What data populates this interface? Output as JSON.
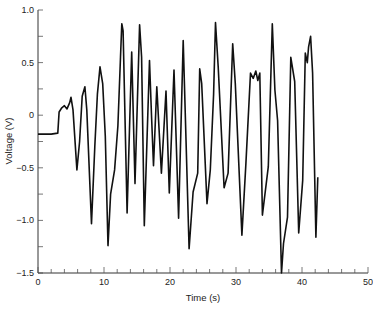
{
  "chart_data": {
    "type": "line",
    "title": "",
    "xlabel": "Time (s)",
    "ylabel": "Voltage (V)",
    "xlim": [
      0,
      50
    ],
    "ylim": [
      -1.5,
      1.0
    ],
    "x_ticks_major": [
      0,
      10,
      20,
      30,
      40,
      50
    ],
    "x_tick_labels": [
      "0",
      "10",
      "20",
      "30",
      "40",
      "50"
    ],
    "x_ticks_minor_step": 2,
    "y_ticks_major": [
      1.0,
      0.5,
      0,
      -0.5,
      -1.0,
      -1.5
    ],
    "y_tick_labels": [
      "1.0",
      "0.5",
      "0",
      "-0.5",
      "-1.0",
      "-1.5"
    ],
    "y_ticks_minor_step": 0.25,
    "grid": false,
    "legend": null,
    "line_color": "#111111",
    "series": [
      {
        "name": "Voltage",
        "x": [
          0,
          1,
          2,
          3.0,
          3.2,
          3.6,
          4.0,
          4.4,
          4.8,
          5.0,
          5.3,
          5.9,
          6.3,
          6.7,
          7.1,
          7.4,
          8.1,
          8.6,
          9.0,
          9.4,
          9.8,
          10.2,
          10.6,
          11.0,
          11.6,
          12.1,
          12.5,
          12.7,
          12.9,
          13.5,
          14.2,
          14.7,
          15.4,
          15.7,
          16.1,
          16.9,
          17.2,
          17.5,
          18.0,
          18.7,
          19.4,
          19.9,
          20.6,
          21.3,
          22.0,
          22.9,
          23.5,
          24.2,
          24.5,
          24.8,
          25.6,
          26.1,
          26.6,
          26.9,
          27.3,
          28.2,
          28.8,
          29.5,
          29.9,
          30.9,
          31.5,
          32.2,
          32.6,
          33.0,
          33.3,
          33.6,
          34.0,
          34.9,
          35.5,
          35.9,
          36.3,
          36.9,
          37.2,
          37.8,
          38.3,
          38.9,
          39.5,
          40.1,
          40.5,
          40.8,
          41.0,
          41.3,
          41.6,
          42.1,
          42.4
        ],
        "y": [
          -0.18,
          -0.18,
          -0.18,
          -0.17,
          0.03,
          0.07,
          0.09,
          0.06,
          0.12,
          0.17,
          0.05,
          -0.52,
          -0.25,
          0.18,
          0.27,
          0.05,
          -1.03,
          -0.3,
          0.2,
          0.46,
          0.3,
          -0.2,
          -1.24,
          -0.75,
          -0.52,
          -0.1,
          0.55,
          0.87,
          0.8,
          -0.93,
          0.6,
          -0.65,
          0.86,
          0.55,
          -1.05,
          0.52,
          0.0,
          -0.48,
          0.27,
          -0.55,
          0.23,
          -0.74,
          0.43,
          -0.98,
          0.71,
          -1.27,
          -0.73,
          -0.55,
          0.44,
          0.3,
          -0.84,
          -0.52,
          0.2,
          0.88,
          0.46,
          -0.69,
          -0.55,
          0.68,
          0.3,
          -1.14,
          -0.46,
          0.4,
          0.35,
          0.42,
          0.33,
          0.4,
          -0.95,
          -0.49,
          0.87,
          0.24,
          -0.05,
          -1.5,
          -1.22,
          -0.97,
          0.55,
          0.32,
          -1.12,
          -0.62,
          0.59,
          0.5,
          0.65,
          0.75,
          0.4,
          -1.16,
          -0.59
        ]
      }
    ]
  },
  "axes": {
    "xlabel": "Time (s)",
    "ylabel": "Voltage (V)"
  }
}
